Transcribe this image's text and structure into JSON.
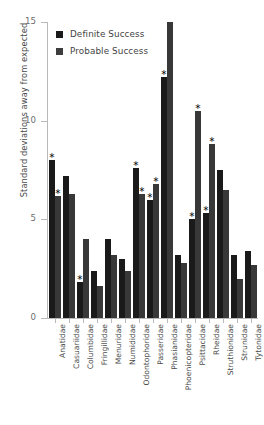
{
  "chart_data": {
    "type": "bar",
    "title": "",
    "xlabel": "",
    "ylabel": "Standard deviations away from expected",
    "ylim": [
      0,
      15
    ],
    "yticks": [
      0,
      5,
      10,
      15
    ],
    "ytick_labels": [
      "0",
      "5",
      "10",
      "15"
    ],
    "grid": false,
    "legend_position": "upper left inside",
    "categories": [
      "Anatidae",
      "Casuariidae",
      "Columbidae",
      "Fringillidae",
      "Menuridae",
      "Numididae",
      "Odontophoridae",
      "Passeridae",
      "Phasianidae",
      "Phoenicopteridae",
      "Psittacidae",
      "Rheidae",
      "Struthionidae",
      "Strunidae",
      "Tytonidae"
    ],
    "series": [
      {
        "name": "Definite Success",
        "color": "#1a1a1a",
        "values": [
          8.0,
          7.2,
          1.8,
          2.4,
          4.0,
          3.0,
          7.6,
          6.0,
          12.2,
          3.2,
          5.0,
          5.3,
          7.5,
          3.2,
          3.4
        ],
        "significant": [
          true,
          false,
          true,
          false,
          false,
          false,
          true,
          true,
          true,
          false,
          true,
          true,
          false,
          false,
          false
        ]
      },
      {
        "name": "Probable Success",
        "color": "#383838",
        "values": [
          6.2,
          6.3,
          4.0,
          1.6,
          3.2,
          2.4,
          6.3,
          6.8,
          15.0,
          2.8,
          10.5,
          8.8,
          6.5,
          2.0,
          2.7
        ],
        "significant": [
          true,
          false,
          false,
          false,
          false,
          false,
          true,
          true,
          false,
          false,
          true,
          true,
          false,
          false,
          false
        ]
      }
    ],
    "annotations": {
      "marker": "∗",
      "marker_name": "significance-asterisk",
      "description": "Asterisks mark bars with significant deviation"
    }
  },
  "legend": {
    "items": [
      {
        "label": "Definite Success",
        "color": "#1a1a1a"
      },
      {
        "label": "Probable Success",
        "color": "#3d3d3d"
      }
    ]
  },
  "axis": {
    "y_title": "Standard deviations away from expected",
    "tick_color": "#b9b9b9",
    "label_color": "#4a4a4a"
  }
}
